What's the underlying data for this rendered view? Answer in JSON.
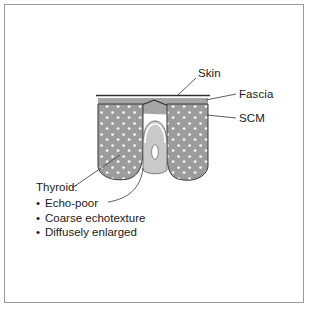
{
  "figure": {
    "kind": "anatomical-cross-section-diagram",
    "background_color": "#ffffff",
    "frame_color": "#9b9b9b"
  },
  "labels": {
    "skin": "Skin",
    "fascia": "Fascia",
    "scm": "SCM"
  },
  "callout": {
    "title": "Thyroid:",
    "bullet_glyph": "•",
    "items": [
      "Echo-poor",
      "Coarse echotexture",
      "Diffusely enlarged"
    ]
  },
  "anatomy": {
    "skin_line": "skin-line",
    "fascia_band": "fascia-band",
    "scm_muscle": "sternocleidomastoid-muscle",
    "thyroid_left_lobe": "thyroid-left-lobe",
    "thyroid_right_lobe": "thyroid-right-lobe",
    "trachea": "trachea",
    "trachea_lumen": "trachea-lumen"
  },
  "colors": {
    "skin_line": "#2e2e2e",
    "fascia_fill": "#a6a6a6",
    "thyroid_fill": "#9c9c9c",
    "thyroid_speckle": "#f2f2f2",
    "trachea_fill": "#c9c9c9",
    "trachea_lumen": "#ffffff",
    "outline": "#3a3a3a",
    "leader_line": "#5a5a5a",
    "text": "#1a1a1a"
  }
}
